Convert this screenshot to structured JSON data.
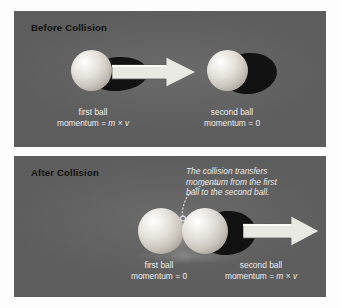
{
  "figure": {
    "background_color": "#fdfdfd",
    "panel_color": "#636363"
  },
  "panels": [
    {
      "id": "before",
      "title": "Before Collision",
      "balls": [
        {
          "name": "first-ball",
          "caption_line1": "first ball",
          "caption_line2_prefix": "momentum = ",
          "caption_line2_m": "m",
          "caption_line2_times": " × ",
          "caption_line2_v": "v"
        },
        {
          "name": "second-ball",
          "caption_line1": "second ball",
          "caption_line2": "momentum = 0"
        }
      ],
      "arrow": {
        "name": "motion-arrow",
        "direction": "right",
        "color": "#e9e9e4"
      }
    },
    {
      "id": "after",
      "title": "After Collision",
      "annotation": {
        "line1": "The collision transfers",
        "line2": "momentum from the first",
        "line3": "ball to the second ball."
      },
      "balls": [
        {
          "name": "first-ball",
          "caption_line1": "first ball",
          "caption_line2": "momentum = 0"
        },
        {
          "name": "second-ball",
          "caption_line1": "second ball",
          "caption_line2_prefix": "momentum = ",
          "caption_line2_m": "m",
          "caption_line2_times": " × ",
          "caption_line2_v": "v"
        }
      ],
      "arrow": {
        "name": "motion-arrow",
        "direction": "right",
        "color": "#e9e9e4"
      }
    }
  ]
}
